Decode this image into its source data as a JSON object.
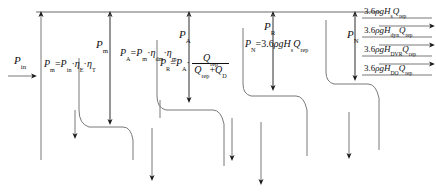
{
  "diagram": {
    "type": "energy-flow-sankey",
    "title": "",
    "line_color": "#5a5a5a",
    "text_color": "#111111",
    "background": "#ffffff"
  },
  "labels": {
    "p_in": {
      "symbol": "P",
      "sub": "in",
      "text": "P in"
    },
    "p_m_title": {
      "symbol": "P",
      "sub": "m",
      "text": "P m"
    },
    "p_m_formula": {
      "text": "P m = P in · η E · η T",
      "parts": [
        "P",
        "m",
        "=",
        "P",
        "in",
        "·",
        "η",
        "E",
        "·",
        "η",
        "T"
      ]
    },
    "p_a_title": {
      "symbol": "P",
      "sub": "A",
      "text": "P A"
    },
    "p_a_formula": {
      "text": "P A = P m · η dm · η m",
      "parts": [
        "P",
        "A",
        "=",
        "P",
        "m",
        "·",
        "η",
        "dm",
        "·",
        "η",
        "m"
      ]
    },
    "p_r_title": {
      "symbol": "P",
      "sub": "R",
      "text": "P R"
    },
    "p_r_formula": {
      "lead": "P R = P A ·",
      "numerator": "Q rep",
      "denominator": "Q rep + Q D",
      "text": "P R = P A · Q rep / ( Q rep + Q D )"
    },
    "p_n_title": {
      "symbol": "P",
      "sub": "N",
      "text": "P N"
    },
    "p_n_formula": {
      "text": "P N = 3.6 ρ g H s Q rep"
    },
    "out1": {
      "text": "3.6 ρ g H s Q rep",
      "head": "H",
      "sub": "s"
    },
    "out2": {
      "text": "3.6 ρ g H dyn Q rep",
      "head": "H",
      "sub": "dyn"
    },
    "out3": {
      "text": "3.6 ρ g H DVR Q rep",
      "head": "H",
      "sub": "DVR"
    },
    "out4": {
      "text": "3.6 ρ g H DO Q rep",
      "head": "H",
      "sub": "DO"
    }
  },
  "constants": {
    "coefficient": "3.6",
    "rho": "ρ",
    "g": "g",
    "Q": "Q",
    "Q_sub": "rep"
  }
}
